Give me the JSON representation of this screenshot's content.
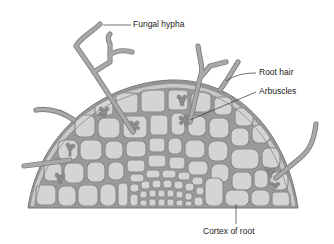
{
  "figure": {
    "labels": {
      "fungal_hypha": "Fungal hypha",
      "root_hair": "Root hair",
      "arbuscles": "Arbuscles",
      "cortex": "Cortex of root"
    },
    "colors": {
      "cell_fill": "#d4d4d4",
      "cell_wall": "#8a8a8a",
      "hypha": "#a9a9a9",
      "hypha_edge": "#7f7f7f",
      "arbuscle": "#8e8e8e",
      "leader_line": "#333333",
      "text": "#222222"
    }
  }
}
